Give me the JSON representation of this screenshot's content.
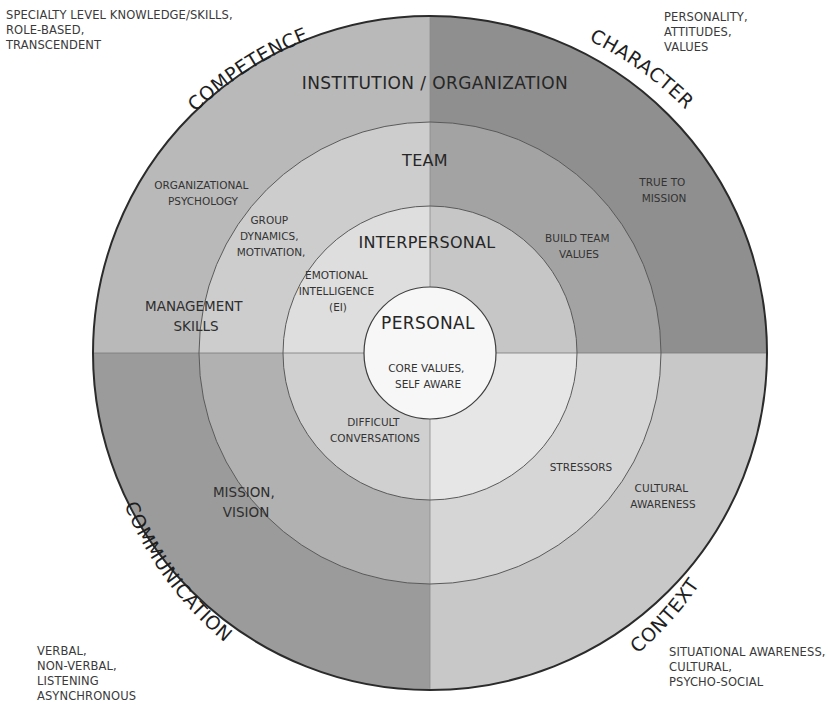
{
  "diagram": {
    "quadrants": {
      "top_left": {
        "label": "COMPETENCE",
        "note": [
          "SPECIALTY LEVEL KNOWLEDGE/SKILLS,",
          "ROLE-BASED,",
          "TRANSCENDENT"
        ]
      },
      "top_right": {
        "label": "CHARACTER",
        "note": [
          "PERSONALITY,",
          "ATTITUDES,",
          "VALUES"
        ]
      },
      "bottom_left": {
        "label": "COMMUNICATION",
        "note": [
          "VERBAL,",
          "NON-VERBAL,",
          "LISTENING",
          "ASYNCHRONOUS"
        ]
      },
      "bottom_right": {
        "label": "CONTEXT",
        "note": [
          "SITUATIONAL AWARENESS,",
          "CULTURAL,",
          "PSYCHO-SOCIAL"
        ]
      }
    },
    "rings": {
      "institution": {
        "title": "INSTITUTION / ORGANIZATION",
        "top_left": [
          "ORGANIZATIONAL",
          "PSYCHOLOGY"
        ],
        "top_right": [
          "TRUE TO",
          "MISSION"
        ],
        "left": [
          "MANAGEMENT",
          "SKILLS"
        ],
        "bottom_left": [
          "MISSION,",
          "VISION"
        ],
        "bottom_right": [
          "CULTURAL",
          "AWARENESS"
        ]
      },
      "team": {
        "title": "TEAM",
        "top_left": [
          "GROUP",
          "DYNAMICS,",
          "MOTIVATION,"
        ],
        "top_right": [
          "BUILD TEAM",
          "VALUES"
        ],
        "bottom_right": [
          "STRESSORS"
        ]
      },
      "interpersonal": {
        "title": "INTERPERSONAL",
        "top_left": [
          "EMOTIONAL",
          "INTELLIGENCE",
          "(EI)"
        ],
        "bottom_left": [
          "DIFFICULT",
          "CONVERSATIONS"
        ]
      },
      "personal": {
        "title": "PERSONAL",
        "body": [
          "CORE VALUES,",
          "SELF AWARE"
        ]
      }
    },
    "colors": {
      "tl": [
        "#b9b9b9",
        "#cdcdcd",
        "#dedede"
      ],
      "tr": [
        "#8f8f8f",
        "#a3a3a3",
        "#c6c6c6"
      ],
      "bl": [
        "#9b9b9b",
        "#b1b1b1",
        "#d0d0d0"
      ],
      "br": [
        "#c8c8c8",
        "#d6d6d6",
        "#e6e6e6"
      ],
      "personal": "#f7f7f7",
      "outline": "#333333"
    }
  }
}
